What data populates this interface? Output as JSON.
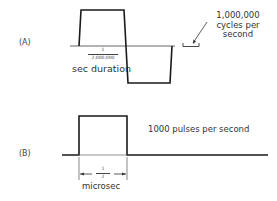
{
  "figure": {
    "panel_a": {
      "label": "(A)",
      "duration_fraction": {
        "numerator": "1",
        "denominator": "2,000,000"
      },
      "duration_text": "sec duration",
      "frequency_annotation": [
        "1,000,000",
        "cycles per",
        "second"
      ],
      "waveform": "square-wave-cycle"
    },
    "panel_b": {
      "label": "(B)",
      "pulse_width_fraction": {
        "numerator": "1",
        "denominator": "2"
      },
      "pulse_width_unit": "microsec",
      "rate_text": "1000 pulses per second",
      "waveform": "single-rectangular-pulse"
    },
    "colors": {
      "line": "#1a1a1a",
      "baseline": "#555555",
      "background": "#ffffff"
    }
  }
}
